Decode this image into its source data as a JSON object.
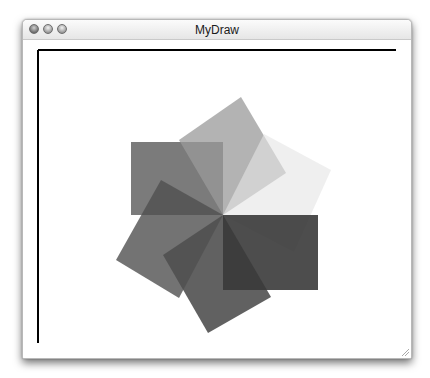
{
  "window": {
    "title": "MyDraw",
    "buttons": [
      {
        "name": "close",
        "icon": "close-icon"
      },
      {
        "name": "minimize",
        "icon": "minimize-icon"
      },
      {
        "name": "zoom",
        "icon": "zoom-icon"
      }
    ]
  },
  "canvas": {
    "background": "#ffffff",
    "axes_color": "#000000",
    "shapes": [
      {
        "name": "rect-upper-left",
        "points": "108,102 200,102 200,175 108,175",
        "fill": "#5a5a5a",
        "opacity": 0.8
      },
      {
        "name": "rect-top-light",
        "points": "200,175 156,100 218,57 263,133",
        "fill": "#9a9a9a",
        "opacity": 0.75
      },
      {
        "name": "rect-right-faint",
        "points": "200,175 241,94 308,130 271,212",
        "fill": "#e4e4e4",
        "opacity": 0.6
      },
      {
        "name": "rect-lower-right",
        "points": "200,175 295,175 295,250 200,250",
        "fill": "#2e2e2e",
        "opacity": 0.85
      },
      {
        "name": "rect-bottom",
        "points": "200,175 140,215 185,293 248,257",
        "fill": "#3a3a3a",
        "opacity": 0.8
      },
      {
        "name": "rect-lower-left",
        "points": "200,175 138,140 93,220 156,258",
        "fill": "#505050",
        "opacity": 0.8
      }
    ]
  }
}
